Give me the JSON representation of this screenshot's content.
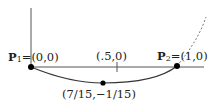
{
  "diagram": {
    "type": "curve-sketch",
    "points": {
      "p1": {
        "name": "P",
        "sub": "1",
        "coords": "=(0,0)"
      },
      "p2": {
        "name": "P",
        "sub": "2",
        "coords": "=(1,0)"
      },
      "mid": {
        "label": "(.5,0)"
      },
      "min": {
        "label": "(7/15,−1/15)"
      }
    },
    "colors": {
      "stroke": "#333333",
      "dot": "#000000",
      "dashed": "#777777"
    }
  }
}
